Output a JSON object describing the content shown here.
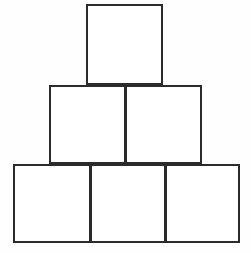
{
  "figure": {
    "canvas": {
      "width": 251,
      "height": 253
    },
    "colors": {
      "background": "#fefefe",
      "stroke": "#2b2b2b",
      "fill": "#ffffff"
    },
    "stroke_width": 2,
    "rows": [
      {
        "name": "top-row",
        "count": 1,
        "blocks": [
          {
            "id": "top",
            "label": "",
            "x": 86,
            "y": 4,
            "width": 77,
            "height": 81
          }
        ]
      },
      {
        "name": "middle-row",
        "count": 2,
        "blocks": [
          {
            "id": "mid-left",
            "label": "",
            "x": 49,
            "y": 85,
            "width": 77,
            "height": 79
          },
          {
            "id": "mid-right",
            "label": "",
            "x": 125,
            "y": 85,
            "width": 77,
            "height": 79
          }
        ]
      },
      {
        "name": "bottom-row",
        "count": 3,
        "blocks": [
          {
            "id": "bot-left",
            "label": "",
            "x": 13,
            "y": 164,
            "width": 78,
            "height": 79
          },
          {
            "id": "bot-center",
            "label": "",
            "x": 90,
            "y": 164,
            "width": 76,
            "height": 79
          },
          {
            "id": "bot-right",
            "label": "",
            "x": 165,
            "y": 164,
            "width": 75,
            "height": 79
          }
        ]
      }
    ]
  },
  "chart_data": {
    "type": "bar",
    "categories": [
      "Top row",
      "Middle row",
      "Bottom row"
    ],
    "values": [
      1,
      2,
      3
    ],
    "xlabel": "",
    "ylabel": "Number of blocks",
    "ylim": [
      0,
      3
    ]
  }
}
